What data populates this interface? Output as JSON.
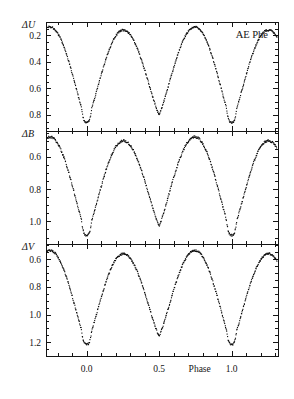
{
  "figure": {
    "object_label": "AE Phe",
    "xlabel": "Phase",
    "panels": [
      {
        "id": "U",
        "ylabel_delta": "Δ",
        "ylabel_band": "U"
      },
      {
        "id": "B",
        "ylabel_delta": "Δ",
        "ylabel_band": "B"
      },
      {
        "id": "V",
        "ylabel_delta": "Δ",
        "ylabel_band": "V"
      }
    ]
  },
  "chart_data": {
    "type": "scatter",
    "title": "AE Phe",
    "subtitle": "",
    "xlabel": "Phase",
    "ylabel": "Differential magnitude",
    "annotations": [
      "AE Phe"
    ],
    "legend": [],
    "legend_position": "none",
    "grid": false,
    "xlim": [
      -0.28,
      1.32
    ],
    "xticks": [
      0.0,
      0.5,
      1.0
    ],
    "xticklabels": [
      "0.0",
      "0.5",
      "1.0"
    ],
    "x_minor_tick_step": 0.1,
    "y_inverted": true,
    "marker": "dot",
    "marker_size": 1.1,
    "marker_color": "#0a0a0a",
    "panels": [
      {
        "name": "U",
        "ylabel": "ΔU",
        "ylim": [
          0.92,
          0.1
        ],
        "yticks": [
          0.2,
          0.4,
          0.6,
          0.8
        ],
        "yticklabels": [
          "0.2",
          "0.4",
          "0.6",
          "0.8"
        ],
        "y_minor_tick_step": 0.05,
        "max_brightness_mag": 0.155,
        "primary_min_mag": 0.855,
        "secondary_min_mag": 0.795,
        "primary_min_phases": [
          0.0,
          1.0
        ],
        "secondary_min_phases": [
          0.5
        ],
        "primary_flat_halfwidth_phase": 0.035,
        "amplitude_mag": 0.7,
        "n_points": 560
      },
      {
        "name": "B",
        "ylabel": "ΔB",
        "ylim": [
          1.14,
          0.44
        ],
        "yticks": [
          0.6,
          0.8,
          1.0
        ],
        "yticklabels": [
          "0.6",
          "0.8",
          "1.0"
        ],
        "y_minor_tick_step": 0.05,
        "max_brightness_mag": 0.495,
        "primary_min_mag": 1.085,
        "secondary_min_mag": 1.025,
        "primary_min_phases": [
          0.0,
          1.0
        ],
        "secondary_min_phases": [
          0.5
        ],
        "primary_flat_halfwidth_phase": 0.035,
        "amplitude_mag": 0.59,
        "n_points": 560
      },
      {
        "name": "V",
        "ylabel": "ΔV",
        "ylim": [
          1.3,
          0.49
        ],
        "yticks": [
          0.6,
          0.8,
          1.0,
          1.2
        ],
        "yticklabels": [
          "0.6",
          "0.8",
          "1.0",
          "1.2"
        ],
        "y_minor_tick_step": 0.05,
        "max_brightness_mag": 0.555,
        "primary_min_mag": 1.215,
        "secondary_min_mag": 1.155,
        "primary_min_phases": [
          0.0,
          1.0
        ],
        "secondary_min_phases": [
          0.5
        ],
        "primary_flat_halfwidth_phase": 0.035,
        "amplitude_mag": 0.66,
        "n_points": 560
      }
    ]
  },
  "geometry": {
    "plot_left": 46,
    "plot_right": 278,
    "panel_tops": [
      22,
      131,
      244
    ],
    "panel_bottoms": [
      131,
      244,
      356
    ]
  }
}
